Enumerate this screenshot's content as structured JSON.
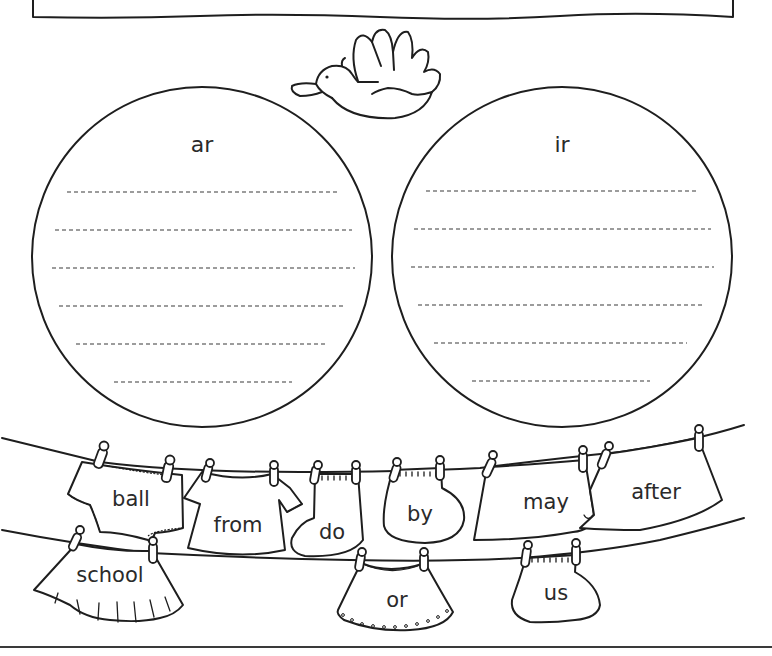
{
  "worksheet": {
    "instruction_box_text": "",
    "circles": [
      {
        "heading": "ar",
        "answer_lines": 6
      },
      {
        "heading": "ir",
        "answer_lines": 6
      }
    ],
    "clothes_words": {
      "upper_line": [
        "ball",
        "from",
        "do",
        "by",
        "may",
        "after"
      ],
      "lower_line": [
        "school",
        "or",
        "us"
      ]
    },
    "decoration": "flying-bird"
  }
}
